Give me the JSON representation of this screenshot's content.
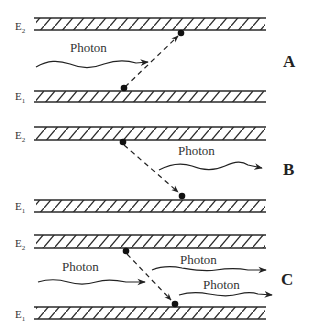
{
  "diagram": {
    "title": "",
    "panels": [
      {
        "id": "A",
        "label": "A",
        "upper_level": "E2",
        "lower_level": "E1",
        "photon_labels": [
          "Photon"
        ],
        "process": "absorption"
      },
      {
        "id": "B",
        "label": "B",
        "upper_level": "E2",
        "lower_level": "E1",
        "photon_labels": [
          "Photon"
        ],
        "process": "spontaneous emission"
      },
      {
        "id": "C",
        "label": "C",
        "upper_level": "E2",
        "lower_level": "E1",
        "photon_labels": [
          "Photon",
          "Photon",
          "Photon"
        ],
        "process": "stimulated emission"
      }
    ],
    "level_letter": "E",
    "sub_upper": "2",
    "sub_lower": "1",
    "colors": {
      "line": "#2a2a2a",
      "background": "#ffffff"
    }
  }
}
